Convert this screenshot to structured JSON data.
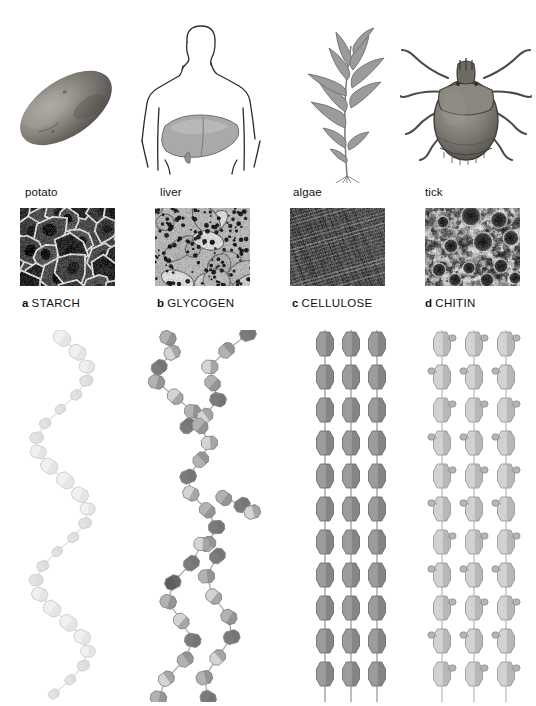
{
  "figure": {
    "background_color": "#ffffff",
    "columns": 4
  },
  "panels": [
    {
      "letter": "a",
      "name": "STARCH",
      "source_label": "potato",
      "organism_icon": "potato-icon",
      "micrograph_caption": "potato-starch-micrograph",
      "micrograph_type": "plant cells with starch granules",
      "structure_type": "helix",
      "structure_icon": "starch-helix-diagram",
      "unit_color": "#f0f0f0",
      "unit_shade_dark": "#d6d6d6",
      "label_x": 22,
      "source_x": 25
    },
    {
      "letter": "b",
      "name": "GLYCOGEN",
      "source_label": "liver",
      "organism_icon": "human-torso-liver-icon",
      "micrograph_caption": "liver-glycogen-micrograph",
      "micrograph_type": "hepatocytes with glycogen granules",
      "structure_type": "branched",
      "structure_icon": "glycogen-branched-diagram",
      "unit_color": "#bfbfbf",
      "unit_shade_dark": "#6e6e6e",
      "label_x": 157,
      "source_x": 160
    },
    {
      "letter": "c",
      "name": "CELLULOSE",
      "source_label": "algae",
      "organism_icon": "algae-icon",
      "micrograph_caption": "algae-cellulose-micrograph",
      "micrograph_type": "crosshatched cellulose fibrils",
      "structure_type": "parallel-chains",
      "structure_icon": "cellulose-parallel-chains-diagram",
      "unit_color": "#9c9c9c",
      "unit_shade_dark": "#6a6a6a",
      "label_x": 292,
      "source_x": 293
    },
    {
      "letter": "d",
      "name": "CHITIN",
      "source_label": "tick",
      "organism_icon": "tick-icon",
      "micrograph_caption": "tick-chitin-micrograph",
      "micrograph_type": "chitinous cuticle surface with pits",
      "structure_type": "parallel-chains-with-sidegroups",
      "structure_icon": "chitin-parallel-chains-diagram",
      "unit_color": "#d2d2d2",
      "unit_shade_dark": "#9a9a9a",
      "label_x": 425,
      "source_x": 425
    }
  ],
  "colors": {
    "ink": "#111111",
    "line_art": "#2b2b2b",
    "organism_fill": "#8c8c8c",
    "liver_fill": "#a8a8a8",
    "algae_fill": "#9b9b9b",
    "tick_fill": "#7d7d7d",
    "potato_fill": "#757575"
  }
}
